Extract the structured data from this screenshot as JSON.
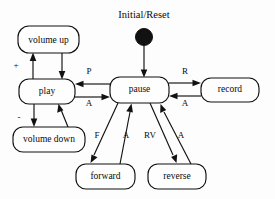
{
  "diagram": {
    "kind": "state-machine-diagram",
    "title": "Initial/Reset",
    "background_color": "#fdfdfd",
    "line_color": "#111111",
    "text_color": "#0a0a0a",
    "states": [
      {
        "id": "volume_up",
        "label": "volume up",
        "x": 18,
        "y": 26,
        "w": 61,
        "h": 27,
        "font_size": 9.5
      },
      {
        "id": "play",
        "label": "play",
        "x": 19,
        "y": 79,
        "w": 56,
        "h": 25,
        "font_size": 9.5
      },
      {
        "id": "volume_down",
        "label": "volume down",
        "x": 13,
        "y": 127,
        "w": 72,
        "h": 25,
        "font_size": 9.5
      },
      {
        "id": "pause",
        "label": "pause",
        "x": 110,
        "y": 77,
        "w": 59,
        "h": 26,
        "font_size": 9.5
      },
      {
        "id": "record",
        "label": "record",
        "x": 201,
        "y": 78,
        "w": 58,
        "h": 24,
        "font_size": 9.5
      },
      {
        "id": "forward",
        "label": "forward",
        "x": 76,
        "y": 164,
        "w": 59,
        "h": 25,
        "font_size": 9.5
      },
      {
        "id": "reverse",
        "label": "reverse",
        "x": 148,
        "y": 164,
        "w": 58,
        "h": 25,
        "font_size": 9.5
      }
    ],
    "initial_marker": {
      "name": "Initial/Reset",
      "title_x": 144,
      "title_y": 16,
      "title_font_size": 10.5,
      "dot_cx": 144,
      "dot_cy": 37,
      "dot_r": 8.5,
      "target_state": "pause"
    },
    "transitions": [
      {
        "id": "t_init_pause",
        "label": "",
        "from": "initial",
        "to": "pause"
      },
      {
        "id": "t_play_volup",
        "label": "+",
        "from": "play",
        "to": "volume_up"
      },
      {
        "id": "t_volup_play",
        "label": "",
        "from": "volume_up",
        "to": "play"
      },
      {
        "id": "t_play_voldown",
        "label": "-",
        "from": "play",
        "to": "volume_down"
      },
      {
        "id": "t_voldown_play",
        "label": "",
        "from": "volume_down",
        "to": "play"
      },
      {
        "id": "t_pause_play",
        "label": "P",
        "from": "pause",
        "to": "play"
      },
      {
        "id": "t_play_pause",
        "label": "A",
        "from": "play",
        "to": "pause"
      },
      {
        "id": "t_pause_record",
        "label": "R",
        "from": "pause",
        "to": "record"
      },
      {
        "id": "t_record_pause",
        "label": "A",
        "from": "record",
        "to": "pause"
      },
      {
        "id": "t_pause_forward",
        "label": "F",
        "from": "pause",
        "to": "forward"
      },
      {
        "id": "t_forward_pause",
        "label": "A",
        "from": "forward",
        "to": "pause"
      },
      {
        "id": "t_pause_reverse",
        "label": "RV",
        "from": "pause",
        "to": "reverse"
      },
      {
        "id": "t_reverse_pause",
        "label": "A",
        "from": "reverse",
        "to": "pause"
      }
    ],
    "edge_labels": [
      {
        "id": "lbl_plus",
        "text": "+",
        "x": 16,
        "y": 66,
        "font_size": 9
      },
      {
        "id": "lbl_minus",
        "text": "-",
        "x": 19,
        "y": 118,
        "font_size": 9
      },
      {
        "id": "lbl_p",
        "text": "P",
        "x": 89,
        "y": 72,
        "font_size": 9
      },
      {
        "id": "lbl_a_play",
        "text": "A",
        "x": 89,
        "y": 104,
        "font_size": 9
      },
      {
        "id": "lbl_r",
        "text": "R",
        "x": 185,
        "y": 72,
        "font_size": 9
      },
      {
        "id": "lbl_a_rec",
        "text": "A",
        "x": 185,
        "y": 104,
        "font_size": 9
      },
      {
        "id": "lbl_f",
        "text": "F",
        "x": 97,
        "y": 136,
        "font_size": 9
      },
      {
        "id": "lbl_a_fwd",
        "text": "A",
        "x": 126,
        "y": 136,
        "font_size": 9
      },
      {
        "id": "lbl_rv",
        "text": "RV",
        "x": 150,
        "y": 136,
        "font_size": 9
      },
      {
        "id": "lbl_a_rev",
        "text": "A",
        "x": 181,
        "y": 136,
        "font_size": 9
      }
    ]
  }
}
